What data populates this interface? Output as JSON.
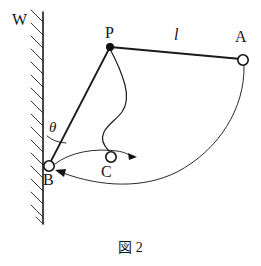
{
  "figure": {
    "caption": "図 2",
    "background_color": "#ffffff",
    "ink_color": "#111111"
  },
  "labels": {
    "wall": "W",
    "pivot": "P",
    "bob_initial": "A",
    "bob_final": "B",
    "bob_middle": "C",
    "length": "l",
    "angle": "θ"
  },
  "diagram_data": {
    "type": "physics-schematic",
    "description": "Pendulum of length l pivoted at P on a wall W; bob swings from A through C to B; angle theta between wall and string PB",
    "nodes": [
      {
        "name": "P",
        "label": "P",
        "x": 110,
        "y": 47,
        "style": "filled-dot",
        "radius": 3.4
      },
      {
        "name": "A",
        "label": "A",
        "x": 243,
        "y": 60,
        "style": "open-circle",
        "radius": 5.2
      },
      {
        "name": "B",
        "label": "B",
        "x": 49,
        "y": 166,
        "style": "open-circle",
        "radius": 5.2
      },
      {
        "name": "C",
        "label": "C",
        "x": 111,
        "y": 157,
        "style": "open-circle",
        "radius": 5.2
      }
    ],
    "wall": {
      "x": 43,
      "y_top": 12,
      "y_bottom": 224,
      "hatch_side": "left",
      "hatch_count": 17
    },
    "segments": [
      {
        "name": "string-PA",
        "from": "P",
        "to": "A",
        "label": "l"
      },
      {
        "name": "string-PB",
        "from": "P",
        "to": "B",
        "label": ""
      }
    ],
    "curves": [
      {
        "name": "swing-arc-A-to-B",
        "kind": "arc",
        "from": "A",
        "to": "B",
        "arrow_at": "B"
      },
      {
        "name": "velocity-arc-B-to-right",
        "kind": "arc",
        "from": "B",
        "through": "C",
        "arrow_at": "right"
      },
      {
        "name": "wavy-string-P-to-C",
        "kind": "wavy",
        "from": "P",
        "to": "C"
      }
    ],
    "angle_marker": {
      "name": "theta",
      "vertex": "B",
      "between": [
        "wall-up",
        "string-BP"
      ],
      "label": "θ"
    }
  }
}
